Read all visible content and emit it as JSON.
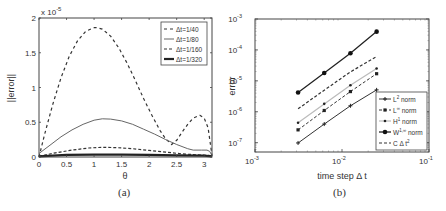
{
  "figure": {
    "caption_a": "(a)",
    "caption_b": "(b)"
  },
  "chart_data": [
    {
      "id": "a",
      "type": "line",
      "title": "",
      "xlabel": "θ",
      "ylabel": "||error||",
      "y_multiplier_label": "x 10",
      "y_multiplier_exp": "-5",
      "xlim": [
        0,
        3.1416
      ],
      "ylim": [
        0,
        2
      ],
      "xticks": [
        0,
        0.5,
        1,
        1.5,
        2,
        2.5,
        3
      ],
      "xtick_labels": [
        "0",
        "0.5",
        "1",
        "1.5",
        "2",
        "2.5",
        "3"
      ],
      "yticks": [
        0,
        0.5,
        1,
        1.5,
        2
      ],
      "ytick_labels": [
        "0",
        "0.5",
        "1",
        "1.5",
        "2"
      ],
      "grid": false,
      "legend_position": "upper right",
      "series": [
        {
          "name": "Δt=1/40",
          "style": "dash-sparse",
          "x": [
            0,
            0.1,
            0.25,
            0.4,
            0.55,
            0.7,
            0.85,
            1.0,
            1.05,
            1.15,
            1.3,
            1.45,
            1.6,
            1.75,
            1.9,
            2.05,
            2.2,
            2.3,
            2.41,
            2.5,
            2.6,
            2.7,
            2.8,
            2.92,
            3.0,
            3.07,
            3.1416
          ],
          "y": [
            0,
            0.32,
            0.76,
            1.14,
            1.45,
            1.67,
            1.81,
            1.86,
            1.86,
            1.84,
            1.74,
            1.57,
            1.35,
            1.1,
            0.84,
            0.6,
            0.38,
            0.26,
            0.18,
            0.24,
            0.36,
            0.47,
            0.56,
            0.6,
            0.56,
            0.42,
            0.02
          ]
        },
        {
          "name": "Δt=1/80",
          "style": "solid-thin",
          "x": [
            0,
            0.2,
            0.4,
            0.6,
            0.8,
            1.0,
            1.15,
            1.3,
            1.5,
            1.7,
            1.9,
            2.1,
            2.3,
            2.5,
            2.7,
            2.8,
            2.95,
            3.05,
            3.1,
            3.1416
          ],
          "y": [
            0.05,
            0.17,
            0.29,
            0.39,
            0.47,
            0.53,
            0.55,
            0.545,
            0.52,
            0.47,
            0.4,
            0.33,
            0.25,
            0.18,
            0.12,
            0.1,
            0.1,
            0.1,
            0.08,
            0.02
          ]
        },
        {
          "name": "Δt=1/160",
          "style": "dash",
          "x": [
            0,
            0.3,
            0.6,
            0.9,
            1.15,
            1.4,
            1.7,
            2.0,
            2.3,
            2.6,
            2.9,
            3.1416
          ],
          "y": [
            0.01,
            0.06,
            0.1,
            0.13,
            0.14,
            0.135,
            0.12,
            0.095,
            0.07,
            0.045,
            0.03,
            0.02
          ]
        },
        {
          "name": "Δt=1/320",
          "style": "solid-thick",
          "x": [
            0,
            0.5,
            1.0,
            1.5,
            2.0,
            2.5,
            3.0,
            3.1416
          ],
          "y": [
            0.01,
            0.03,
            0.035,
            0.035,
            0.03,
            0.025,
            0.02,
            0.01
          ]
        }
      ]
    },
    {
      "id": "b",
      "type": "line",
      "title": "",
      "xlabel": "time step Δ t",
      "ylabel": "error",
      "xscale": "log",
      "yscale": "log",
      "xlim": [
        0.001,
        0.1
      ],
      "ylim": [
        5e-08,
        0.001
      ],
      "xticks": [
        0.001,
        0.01,
        0.1
      ],
      "xtick_labels": [
        {
          "base": "10",
          "exp": "-3"
        },
        {
          "base": "10",
          "exp": "-2"
        },
        {
          "base": "10",
          "exp": "-1"
        }
      ],
      "yticks": [
        1e-07,
        1e-06,
        1e-05,
        0.0001,
        0.001
      ],
      "ytick_labels": [
        {
          "base": "10",
          "exp": "-7"
        },
        {
          "base": "10",
          "exp": "-6"
        },
        {
          "base": "10",
          "exp": "-5"
        },
        {
          "base": "10",
          "exp": "-4"
        },
        {
          "base": "10",
          "exp": "-3"
        }
      ],
      "grid": false,
      "legend_position": "lower right",
      "x": [
        0.003125,
        0.00625,
        0.0125,
        0.025
      ],
      "series": [
        {
          "name": "L² norm",
          "legend_base": "L",
          "legend_sup": "2",
          "legend_tail": " norm",
          "style": "solid-plus",
          "values": [
            9.8e-08,
            4e-07,
            1.56e-06,
            5.1e-06
          ]
        },
        {
          "name": "L∞ norm",
          "legend_base": "L",
          "legend_sup": "∞",
          "legend_tail": " norm",
          "style": "dash-square",
          "values": [
            2.6e-07,
            1.1e-06,
            4.5e-06,
            1.7e-05
          ]
        },
        {
          "name": "H¹ norm",
          "legend_base": "H",
          "legend_sup": "1",
          "legend_tail": " norm",
          "style": "light-dot",
          "values": [
            4.4e-07,
            1.8e-06,
            7.2e-06,
            2.5e-05
          ]
        },
        {
          "name": "W¹,∞ norm",
          "legend_base": "W",
          "legend_sup": "1,∞",
          "legend_tail": " norm",
          "style": "solid-bigdot",
          "values": [
            4.2e-06,
            1.8e-05,
            7.8e-05,
            0.00039
          ]
        },
        {
          "name": "C Δt²",
          "legend_base": "C Δ t",
          "legend_sup": "2",
          "legend_tail": "",
          "style": "dash",
          "values": [
            1.25e-06,
            5e-06,
            1.95e-05,
            6.1e-05
          ]
        }
      ]
    }
  ]
}
